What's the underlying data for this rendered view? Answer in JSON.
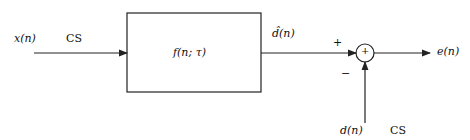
{
  "diagram": {
    "input_label": "x(n)",
    "input_channel": "CS",
    "block_label": "f(n; τ)",
    "estimate_label": "d̂(n)",
    "plus_sign": "+",
    "minus_sign": "−",
    "sum_symbol": "+",
    "output_label": "e(n)",
    "desired_label": "d(n)",
    "desired_channel": "CS"
  },
  "colors": {
    "stroke": "#222222",
    "background": "#ffffff"
  }
}
